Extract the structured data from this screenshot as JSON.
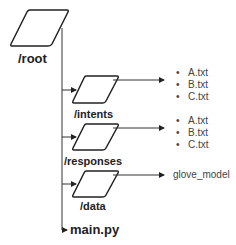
{
  "diagram": {
    "root": {
      "label": "/root"
    },
    "folders": [
      {
        "label": "/intents",
        "files": [
          "A.txt",
          "B.txt",
          "C.txt"
        ]
      },
      {
        "label": "/responses",
        "files": [
          "A.txt",
          "B.txt",
          "C.txt"
        ]
      },
      {
        "label": "/data",
        "target": "glove_model"
      }
    ],
    "main_file": {
      "label": "main.py"
    },
    "colors": {
      "stroke": "#222222",
      "text": "#222222",
      "file_text": "#444444"
    }
  }
}
